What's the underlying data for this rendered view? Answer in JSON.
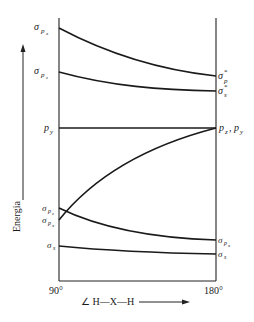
{
  "diagram": {
    "type": "walsh-diagram",
    "y_axis_label": "Energia",
    "x_axis_label": "∠ H—X—H",
    "x_start_label": "90°",
    "x_end_label": "180°",
    "left_labels": [
      {
        "sym": "σ",
        "sub": "pₓ",
        "y": 28
      },
      {
        "sym": "σ",
        "sub": "p_z",
        "y": 72
      },
      {
        "sym": "p",
        "sub": "y",
        "y": 128
      },
      {
        "sym": "σ",
        "sub": "p_z",
        "y": 208
      },
      {
        "sym": "σ",
        "sub": "pₓ",
        "y": 220
      },
      {
        "sym": "σ",
        "sub": "s",
        "y": 246
      }
    ],
    "right_labels": [
      {
        "text": "σ*p",
        "y": 76
      },
      {
        "text": "σ*s",
        "y": 91
      },
      {
        "text": "pz, py",
        "y": 128
      },
      {
        "text": "σpx",
        "y": 240
      },
      {
        "text": "σs",
        "y": 254
      }
    ],
    "curves": [
      {
        "name": "sigma-px-antibonding",
        "from": [
          59,
          28
        ],
        "to": [
          216,
          76
        ],
        "shape": "concave-decay"
      },
      {
        "name": "sigma-pz-antibonding",
        "from": [
          59,
          72
        ],
        "to": [
          216,
          91
        ],
        "shape": "concave-decay"
      },
      {
        "name": "py-nonbonding",
        "from": [
          59,
          128
        ],
        "to": [
          216,
          128
        ],
        "shape": "flat"
      },
      {
        "name": "pz-rising",
        "from": [
          59,
          220
        ],
        "to": [
          216,
          128
        ],
        "shape": "rising"
      },
      {
        "name": "sigma-px-bonding",
        "from": [
          59,
          208
        ],
        "to": [
          216,
          240
        ],
        "shape": "concave-decay"
      },
      {
        "name": "sigma-s-bonding",
        "from": [
          59,
          246
        ],
        "to": [
          216,
          254
        ],
        "shape": "slight-decay"
      }
    ]
  }
}
